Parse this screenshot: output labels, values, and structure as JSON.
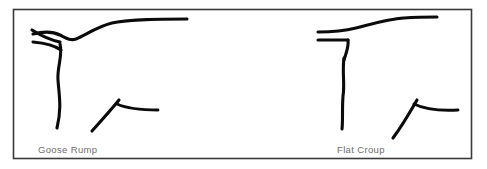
{
  "page": {
    "background_color": "#ffffff",
    "width": 487,
    "height": 169
  },
  "frame": {
    "name": "diagram-border",
    "stroke_color": "#3a3a3c",
    "x": 13.5,
    "y": 9.5,
    "width": 458,
    "height": 149
  },
  "style": {
    "line_color": "#0b0b0b",
    "line_width": 3.1,
    "caption_color": "#6e6e70",
    "caption_size": "9.5px"
  },
  "figures": [
    {
      "id": "goose-rump",
      "caption": "Goose Rump",
      "caption_x": 38,
      "caption_y": 153,
      "strokes": {
        "topline": "M 33 34 C 45 31 54 32 60 35 C 66 38 70 41 76 39 C 86 35 96 27 112 23 C 132 19 160 19 187 19",
        "tail_wedge_upper": "M 32 30 C 40 35 50 40 60 42",
        "tail_wedge_lower": "M 33 42 C 44 43 54 45 61 50",
        "hind_leg": "M 60 44 C 63 56 57 66 58 80 C 59 95 62 108 57 128",
        "hock_diagonal": "M 92 131 C 101 121 110 111 119 100",
        "hock_horizontal": "M 117 104 C 128 109 140 110 158 110"
      }
    },
    {
      "id": "flat-croup",
      "caption": "Flat Croup",
      "caption_x": 337,
      "caption_y": 153,
      "strokes": {
        "topline": "M 318 32 C 332 32 344 31 356 28 C 372 24 388 19 404 18 C 418 17 429 17 437 17",
        "tail_stub": "M 318 40 C 330 40 340 40 348 40",
        "leg_corner": "M 348 40 C 349 47 346 53 344 60",
        "hind_leg": "M 344 58 C 342 72 345 84 343 96 C 342 110 343 120 342 129",
        "hock_diagonal": "M 393 138 C 402 126 409 114 417 100",
        "hock_horizontal": "M 414 104 C 426 110 440 111 458 110"
      }
    }
  ]
}
